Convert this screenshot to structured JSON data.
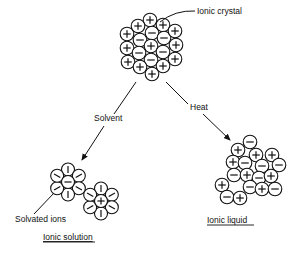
{
  "labels": {
    "crystal": "Ionic crystal",
    "solvent": "Solvent",
    "heat": "Heat",
    "solvated": "Solvated ions",
    "solution": "Ionic solution",
    "liquid": "Ionic liquid"
  },
  "crystal": [
    {
      "x": 150,
      "y": 20,
      "c": "+"
    },
    {
      "x": 138,
      "y": 26,
      "c": "+"
    },
    {
      "x": 152,
      "y": 33,
      "c": "-"
    },
    {
      "x": 163,
      "y": 25,
      "c": "+"
    },
    {
      "x": 127,
      "y": 34,
      "c": "+"
    },
    {
      "x": 140,
      "y": 40,
      "c": "-"
    },
    {
      "x": 164,
      "y": 38,
      "c": "-"
    },
    {
      "x": 175,
      "y": 31,
      "c": "+"
    },
    {
      "x": 127,
      "y": 48,
      "c": "+"
    },
    {
      "x": 151,
      "y": 46,
      "c": "+"
    },
    {
      "x": 176,
      "y": 45,
      "c": "+"
    },
    {
      "x": 139,
      "y": 53,
      "c": "-"
    },
    {
      "x": 163,
      "y": 52,
      "c": "-"
    },
    {
      "x": 128,
      "y": 62,
      "c": "+"
    },
    {
      "x": 151,
      "y": 60,
      "c": "-"
    },
    {
      "x": 175,
      "y": 59,
      "c": "+"
    },
    {
      "x": 140,
      "y": 67,
      "c": "+"
    },
    {
      "x": 163,
      "y": 66,
      "c": "+"
    },
    {
      "x": 152,
      "y": 74,
      "c": "+"
    }
  ],
  "solvated": [
    {
      "cx": 68,
      "cy": 182,
      "c": "-"
    },
    {
      "cx": 101,
      "cy": 201,
      "c": "+"
    }
  ],
  "liquid": [
    {
      "x": 250,
      "y": 142,
      "c": "-"
    },
    {
      "x": 238,
      "y": 150,
      "c": "+"
    },
    {
      "x": 256,
      "y": 155,
      "c": "+"
    },
    {
      "x": 272,
      "y": 155,
      "c": "+"
    },
    {
      "x": 233,
      "y": 162,
      "c": "+"
    },
    {
      "x": 245,
      "y": 163,
      "c": "-"
    },
    {
      "x": 262,
      "y": 166,
      "c": "-"
    },
    {
      "x": 279,
      "y": 165,
      "c": "-"
    },
    {
      "x": 234,
      "y": 175,
      "c": "-"
    },
    {
      "x": 247,
      "y": 175,
      "c": "+"
    },
    {
      "x": 259,
      "y": 178,
      "c": "-"
    },
    {
      "x": 271,
      "y": 176,
      "c": "+"
    },
    {
      "x": 222,
      "y": 185,
      "c": "+"
    },
    {
      "x": 250,
      "y": 187,
      "c": "-"
    },
    {
      "x": 262,
      "y": 189,
      "c": "+"
    },
    {
      "x": 275,
      "y": 189,
      "c": "-"
    },
    {
      "x": 227,
      "y": 197,
      "c": "-"
    },
    {
      "x": 240,
      "y": 198,
      "c": "+"
    }
  ]
}
